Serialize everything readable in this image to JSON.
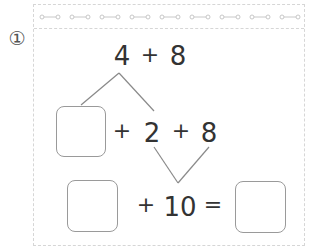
{
  "problem": {
    "number_label": "①",
    "colors": {
      "ink": "#333333",
      "line": "#8a8a8a",
      "box_border": "#9a9a9a",
      "frame": "#d6d6d6"
    }
  },
  "row1": {
    "a": "4",
    "op": "+",
    "b": "8"
  },
  "row2": {
    "box_value": "",
    "op1": "+",
    "a": "2",
    "op2": "+",
    "b": "8"
  },
  "row3": {
    "box_value": "",
    "op": "+",
    "a": "10",
    "eq": "=",
    "result_value": ""
  },
  "decoration": {
    "strip_motif": "o—o",
    "motif_count": 9
  }
}
